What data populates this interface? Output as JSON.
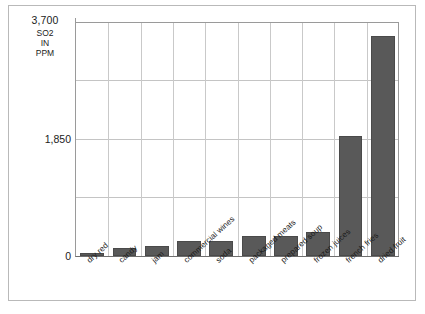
{
  "chart_data": {
    "type": "bar",
    "title": "",
    "xlabel": "",
    "ylabel": "SO2 IN PPM",
    "ylabel_lines": [
      "SO2",
      "IN",
      "PPM"
    ],
    "ylim": [
      0,
      3700
    ],
    "ytick_labels": [
      "0",
      "1,850",
      "3,700"
    ],
    "ytick_values": [
      0,
      1850,
      3700
    ],
    "gridline_values": [
      925,
      1850,
      2775,
      3700
    ],
    "grid": "horizontal-and-vertical",
    "legend": "none",
    "bar_color": "#595959",
    "categories": [
      "dry red",
      "candy",
      "jam",
      "commercial wines",
      "soda",
      "packaged meats",
      "prepared soup",
      "frozen juices",
      "french fries",
      "dried fruit"
    ],
    "values": [
      40,
      130,
      165,
      240,
      240,
      320,
      320,
      385,
      1900,
      3500
    ]
  },
  "axis": {
    "max_label": "3,700",
    "mid_label": "1,850",
    "zero_label": "0"
  }
}
